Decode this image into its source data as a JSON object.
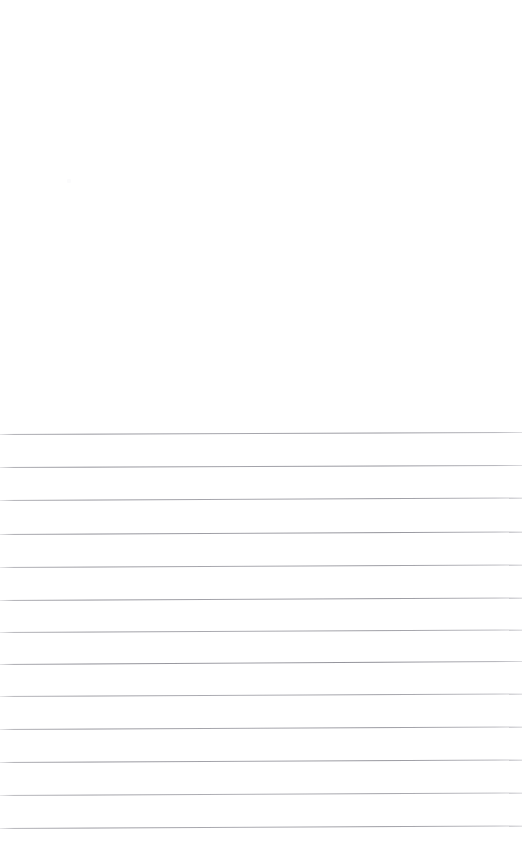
{
  "document": {
    "kind": "scanned-lined-paper",
    "page_width": 522,
    "page_height": 866,
    "background_color": "#ffffff",
    "content_text": "",
    "is_blank": "true",
    "header_region": {
      "label": "blank header area",
      "top": 0,
      "height": 430,
      "text": ""
    },
    "rules": {
      "label": "ruled lines",
      "count": 13,
      "color": "#8e8e96",
      "thickness_px": 1,
      "line_spacing_px": 32.9,
      "first_line_y": 433,
      "last_line_y": 828,
      "left_x": 0,
      "right_x": 522,
      "skew_degrees": -0.24,
      "items": [
        {
          "index": 1,
          "y_left": 433.5,
          "y_right": 431.5,
          "opacity": 0.92
        },
        {
          "index": 2,
          "y_left": 466.5,
          "y_right": 464.5,
          "opacity": 0.95
        },
        {
          "index": 3,
          "y_left": 500.0,
          "y_right": 497.5,
          "opacity": 0.9
        },
        {
          "index": 4,
          "y_left": 533.5,
          "y_right": 531.0,
          "opacity": 0.97
        },
        {
          "index": 5,
          "y_left": 566.5,
          "y_right": 564.0,
          "opacity": 0.88
        },
        {
          "index": 6,
          "y_left": 599.5,
          "y_right": 597.0,
          "opacity": 0.93
        },
        {
          "index": 7,
          "y_left": 631.5,
          "y_right": 629.0,
          "opacity": 0.86
        },
        {
          "index": 8,
          "y_left": 663.5,
          "y_right": 660.5,
          "opacity": 0.99
        },
        {
          "index": 9,
          "y_left": 696.0,
          "y_right": 693.5,
          "opacity": 0.84
        },
        {
          "index": 10,
          "y_left": 729.0,
          "y_right": 726.5,
          "opacity": 0.9
        },
        {
          "index": 11,
          "y_left": 762.0,
          "y_right": 759.5,
          "opacity": 0.93
        },
        {
          "index": 12,
          "y_left": 795.0,
          "y_right": 792.5,
          "opacity": 0.82
        },
        {
          "index": 13,
          "y_left": 828.0,
          "y_right": 825.5,
          "opacity": 0.87
        }
      ]
    },
    "writing_rows": {
      "label": "empty writing rows",
      "count": 12,
      "text": ""
    },
    "artifacts": [
      {
        "name": "scan-speck",
        "x": 67,
        "y": 179,
        "color": "#fbfbfc"
      }
    ]
  }
}
